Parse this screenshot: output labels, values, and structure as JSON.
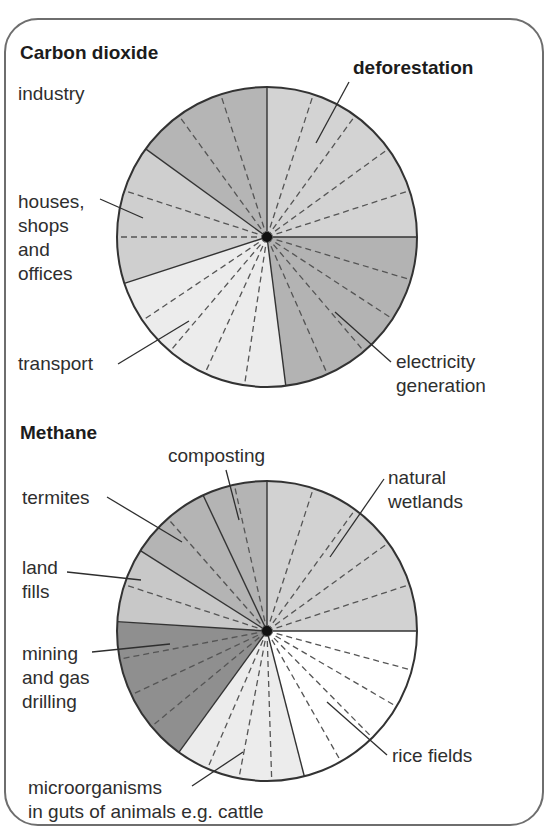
{
  "titles": {
    "co2": "Carbon dioxide",
    "methane": "Methane"
  },
  "labels": {
    "deforestation": "deforestation",
    "industry": "industry",
    "houses": [
      "houses,",
      "shops",
      "and",
      "offices"
    ],
    "transport": "transport",
    "electricity": [
      "electricity",
      "generation"
    ],
    "composting": "composting",
    "natural_wetlands": [
      "natural",
      "wetlands"
    ],
    "termites": "termites",
    "land_fills": [
      "land",
      "fills"
    ],
    "mining": [
      "mining",
      "and gas",
      "drilling"
    ],
    "rice_fields": "rice fields",
    "microorganisms": [
      "microorganisms",
      "in guts of animals e.g. cattle"
    ]
  },
  "chart_data": [
    {
      "type": "pie",
      "title": "Carbon dioxide",
      "categories": [
        "deforestation",
        "electricity generation",
        "transport",
        "houses, shops and offices",
        "industry"
      ],
      "values": [
        25,
        23,
        22,
        15,
        15
      ],
      "start_angle_deg_clockwise_from_top": 0,
      "colors": [
        "#d3d3d3",
        "#b3b3b3",
        "#ececec",
        "#cfcfcf",
        "#b5b5b5"
      ],
      "dashed_subdivisions": [
        5,
        5,
        5,
        3,
        3
      ],
      "center": [
        267,
        237
      ],
      "radius": 150
    },
    {
      "type": "pie",
      "title": "Methane",
      "categories": [
        "natural wetlands",
        "rice fields",
        "microorganisms in guts of animals e.g. cattle",
        "mining and gas drilling",
        "land fills",
        "termites",
        "composting"
      ],
      "values": [
        25,
        21,
        14,
        16,
        8,
        9,
        7
      ],
      "start_angle_deg_clockwise_from_top": 0,
      "colors": [
        "#d2d2d2",
        "#ffffff",
        "#ececec",
        "#8f8f8f",
        "#c8c8c8",
        "#b4b4b4",
        "#b4b4b4"
      ],
      "dashed_subdivisions": [
        5,
        5,
        4,
        4,
        2,
        2,
        2
      ],
      "center": [
        267,
        631
      ],
      "radius": 150
    }
  ]
}
